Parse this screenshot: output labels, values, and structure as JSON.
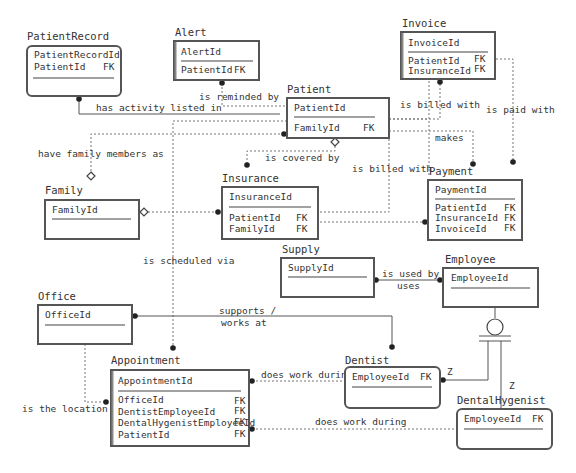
{
  "entities": {
    "patientrecord": {
      "title": "PatientRecord",
      "pk": [
        "PatientRecordId"
      ],
      "attrs": [
        {
          "name": "PatientId",
          "key": "FK"
        }
      ]
    },
    "alert": {
      "title": "Alert",
      "pk": [
        "AlertId"
      ],
      "attrs": [
        {
          "name": "PatientId",
          "key": "FK"
        }
      ]
    },
    "invoice": {
      "title": "Invoice",
      "pk": [
        "InvoiceId"
      ],
      "attrs": [
        {
          "name": "PatientId",
          "key": "FK"
        },
        {
          "name": "InsuranceId",
          "key": "FK"
        }
      ]
    },
    "patient": {
      "title": "Patient",
      "pk": [
        "PatientId"
      ],
      "attrs": [
        {
          "name": "FamilyId",
          "key": "FK"
        }
      ]
    },
    "family": {
      "title": "Family",
      "pk": [
        "FamilyId"
      ],
      "attrs": []
    },
    "insurance": {
      "title": "Insurance",
      "pk": [
        "InsuranceId"
      ],
      "attrs": [
        {
          "name": "PatientId",
          "key": "FK"
        },
        {
          "name": "FamilyId",
          "key": "FK"
        }
      ]
    },
    "payment": {
      "title": "Payment",
      "pk": [
        "PaymentId"
      ],
      "attrs": [
        {
          "name": "PatientId",
          "key": "FK"
        },
        {
          "name": "InsuranceId",
          "key": "FK"
        },
        {
          "name": "InvoiceId",
          "key": "FK"
        }
      ]
    },
    "supply": {
      "title": "Supply",
      "pk": [
        "SupplyId"
      ],
      "attrs": []
    },
    "employee": {
      "title": "Employee",
      "pk": [
        "EmployeeId"
      ],
      "attrs": []
    },
    "office": {
      "title": "Office",
      "pk": [
        "OfficeId"
      ],
      "attrs": []
    },
    "appointment": {
      "title": "Appointment",
      "pk": [
        "AppointmentId"
      ],
      "attrs": [
        {
          "name": "OfficeId",
          "key": "FK"
        },
        {
          "name": "DentistEmployeeId",
          "key": "FK"
        },
        {
          "name": "DentalHygenistEmployeeId",
          "key": "FK"
        },
        {
          "name": "PatientId",
          "key": "FK"
        }
      ]
    },
    "dentist": {
      "title": "Dentist",
      "pk": [],
      "pk_attrs": [
        {
          "name": "EmployeeId",
          "key": "FK"
        }
      ],
      "attrs": []
    },
    "dentalhygenist": {
      "title": "DentalHygenist",
      "pk": [],
      "pk_attrs": [
        {
          "name": "EmployeeId",
          "key": "FK"
        }
      ],
      "attrs": []
    }
  },
  "relationships": {
    "patientrecord_patient": "has activity listed in",
    "alert_patient": "is reminded by",
    "patient_invoice": "is billed with",
    "invoice_payment": "is paid with",
    "patient_payment": "makes",
    "patient_family": "have family members as",
    "patient_insurance": "is covered by",
    "insurance_invoice": "is billed with",
    "patient_appointment": "is scheduled via",
    "supply_employee_1": "is used by /",
    "supply_employee_2": "uses",
    "office_dentist_1": "supports /",
    "office_dentist_2": "works at",
    "office_appointment": "is the location of",
    "dentist_appointment": "does work during",
    "hygenist_appointment": "does work during",
    "subtype_dentist": "Z",
    "subtype_hygenist": "Z"
  }
}
